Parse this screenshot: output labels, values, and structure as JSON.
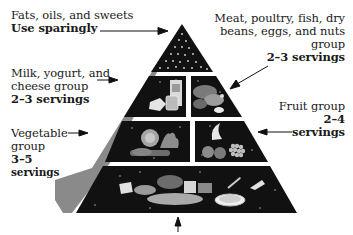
{
  "diagram": {
    "type": "pyramid",
    "colors": {
      "tier_fill": "#111111",
      "side_face": "#8a8a8a",
      "divider": "#f2f2f2",
      "text": "#1a1a1a",
      "arrow": "#111111",
      "background": "#ffffff"
    },
    "labels": {
      "fats": {
        "line1": "Fats, oils, and sweets",
        "bold": "Use sparingly"
      },
      "meat": {
        "line1": "Meat, poultry, fish, dry",
        "line2": "beans, eggs, and nuts",
        "line3": "group",
        "bold": "2–3 servings"
      },
      "milk": {
        "line1": "Milk, yogurt, and",
        "line2": "cheese group",
        "bold": "2–3 servings"
      },
      "fruit": {
        "line1": "Fruit group",
        "bold1": "2–4",
        "bold2": "servings"
      },
      "vegetable": {
        "line1": "Vegetable",
        "line2": "group",
        "bold1": "3–5",
        "bold2": "servings"
      }
    },
    "tiers": [
      {
        "name": "Fats, oils, and sweets",
        "level": 1,
        "servings": "Use sparingly",
        "icon": "dots-pattern-icon"
      },
      {
        "name": "Milk, yogurt, and cheese group",
        "level": 2,
        "servings": "2–3 servings",
        "icon": "dairy-icon"
      },
      {
        "name": "Meat, poultry, fish, dry beans, eggs, and nuts group",
        "level": 2,
        "servings": "2–3 servings",
        "icon": "meat-icon"
      },
      {
        "name": "Vegetable group",
        "level": 3,
        "servings": "3–5 servings",
        "icon": "vegetable-icon"
      },
      {
        "name": "Fruit group",
        "level": 3,
        "servings": "2–4 servings",
        "icon": "fruit-icon"
      },
      {
        "name": "Bread, cereal, rice, and pasta group",
        "level": 4,
        "servings": "",
        "icon": "grain-icon"
      }
    ]
  }
}
